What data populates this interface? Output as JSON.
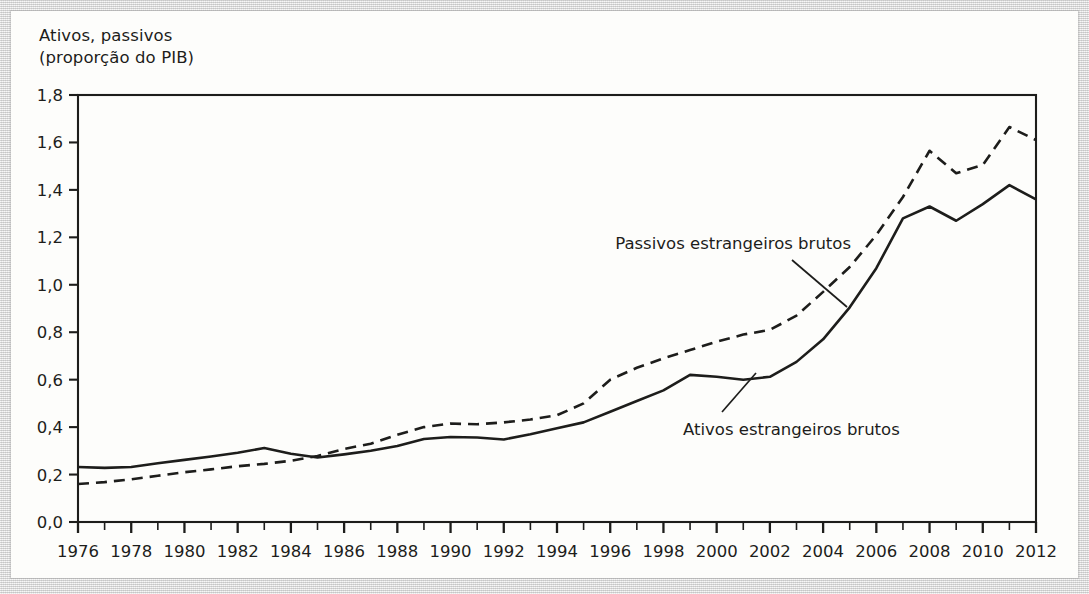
{
  "figure": {
    "axis_title_line1": "Ativos, passivos",
    "axis_title_line2": "(proporção do PIB)",
    "axis_title": "Ativos, passivos\n(proporção do PIB)",
    "frame_color": "#1d1d1b",
    "background_color": "#dcdcdc",
    "card_color": "#fdfdfb"
  },
  "chart_data": {
    "type": "line",
    "title": "",
    "xlabel": "",
    "ylabel": "Ativos, passivos (proporção do PIB)",
    "xlim": [
      1976,
      2012
    ],
    "ylim": [
      0.0,
      1.8
    ],
    "grid": false,
    "legend": "annotations",
    "y_ticks": [
      "0,0",
      "0,2",
      "0,4",
      "0,6",
      "0,8",
      "1,0",
      "1,2",
      "1,4",
      "1,6",
      "1,8"
    ],
    "y_tick_values": [
      0.0,
      0.2,
      0.4,
      0.6,
      0.8,
      1.0,
      1.2,
      1.4,
      1.6,
      1.8
    ],
    "x_ticks": [
      "1976",
      "1978",
      "1980",
      "1982",
      "1984",
      "1986",
      "1988",
      "1990",
      "1992",
      "1994",
      "1996",
      "1998",
      "2000",
      "2002",
      "2004",
      "2006",
      "2008",
      "2010",
      "2012"
    ],
    "x_tick_values": [
      1976,
      1978,
      1980,
      1982,
      1984,
      1986,
      1988,
      1990,
      1992,
      1994,
      1996,
      1998,
      2000,
      2002,
      2004,
      2006,
      2008,
      2010,
      2012
    ],
    "x_minor_step": 1,
    "x": [
      1976,
      1977,
      1978,
      1979,
      1980,
      1981,
      1982,
      1983,
      1984,
      1985,
      1986,
      1987,
      1988,
      1989,
      1990,
      1991,
      1992,
      1993,
      1994,
      1995,
      1996,
      1997,
      1998,
      1999,
      2000,
      2001,
      2002,
      2003,
      2004,
      2005,
      2006,
      2007,
      2008,
      2009,
      2010,
      2011,
      2012
    ],
    "series": [
      {
        "name": "Ativos estrangeiros brutos",
        "style": "solid",
        "color": "#1d1d1b",
        "values": [
          0.232,
          0.228,
          0.232,
          0.248,
          0.262,
          0.276,
          0.292,
          0.312,
          0.288,
          0.272,
          0.285,
          0.3,
          0.32,
          0.35,
          0.358,
          0.356,
          0.348,
          0.37,
          0.395,
          0.42,
          0.465,
          0.51,
          0.555,
          0.62,
          0.612,
          0.6,
          0.612,
          0.675,
          0.77,
          0.905,
          1.07,
          1.28,
          1.33,
          1.27,
          1.34,
          1.42,
          1.36
        ]
      },
      {
        "name": "Passivos estrangeiros brutos",
        "style": "dashed",
        "color": "#1d1d1b",
        "values": [
          0.16,
          0.168,
          0.18,
          0.195,
          0.21,
          0.222,
          0.235,
          0.245,
          0.258,
          0.278,
          0.308,
          0.33,
          0.368,
          0.4,
          0.415,
          0.412,
          0.42,
          0.432,
          0.45,
          0.5,
          0.6,
          0.65,
          0.69,
          0.725,
          0.76,
          0.79,
          0.81,
          0.87,
          0.97,
          1.075,
          1.21,
          1.37,
          1.565,
          1.47,
          1.505,
          1.665,
          1.61
        ]
      }
    ],
    "annotations": [
      {
        "text": "Passivos estrangeiros brutos",
        "target_year": 2003,
        "target_value": 0.88
      },
      {
        "text": "Ativos estrangeiros brutos",
        "target_year": 2003,
        "target_value": 0.66
      }
    ]
  }
}
